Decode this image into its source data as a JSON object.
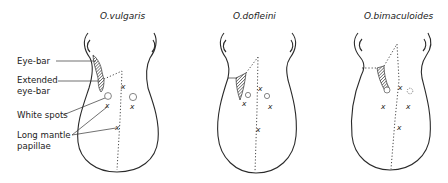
{
  "figure": {
    "panels": [
      {
        "title": "O.vulgaris"
      },
      {
        "title": "O.dofleini"
      },
      {
        "title": "O.bimaculoides"
      }
    ],
    "labels": {
      "eye_bar": "Eye-bar",
      "extended_eye_bar_line1": "Extended",
      "extended_eye_bar_line2": "eye-bar",
      "white_spots": "White spots",
      "long_mantle_papillae_line1": "Long mantle",
      "long_mantle_papillae_line2": "papillae"
    },
    "marks": {
      "papilla_symbol": "x"
    },
    "colors": {
      "line": "#2a2a2a",
      "background": "#ffffff"
    }
  }
}
